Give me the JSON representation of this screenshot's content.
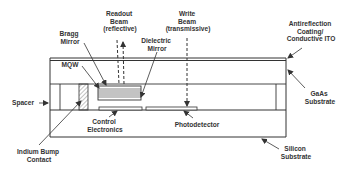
{
  "diagram": {
    "colors": {
      "line": "#333333",
      "fill": "#ffffff",
      "stack": "#555555",
      "hatch": "#666666"
    },
    "labels": {
      "readout_beam": [
        "Readout",
        "Beam",
        "(reflective)"
      ],
      "write_beam": [
        "Write",
        "Beam",
        "(transmissive)"
      ],
      "bragg_mirror": [
        "Bragg",
        "Mirror"
      ],
      "dielectric_mirror": [
        "Dielectric",
        "Mirror"
      ],
      "antireflection": [
        "Antireflection",
        "Coating/",
        "Conductive ITO"
      ],
      "mqw": "MQW",
      "spacer": "Spacer",
      "gaas_substrate": [
        "GaAs",
        "Substrate"
      ],
      "control_electronics": [
        "Control",
        "Electronics"
      ],
      "photodetector": "Photodetector",
      "indium_bump": [
        "Indium Bump",
        "Contact"
      ],
      "silicon_substrate": [
        "Silicon",
        "Substrate"
      ]
    }
  }
}
